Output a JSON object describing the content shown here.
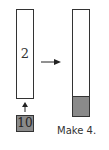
{
  "left_bar": {
    "label": "2"
  },
  "input_box": {
    "label": "10"
  },
  "right_bar": {
    "filled_fraction": 0.18
  },
  "caption": "Make 4."
}
